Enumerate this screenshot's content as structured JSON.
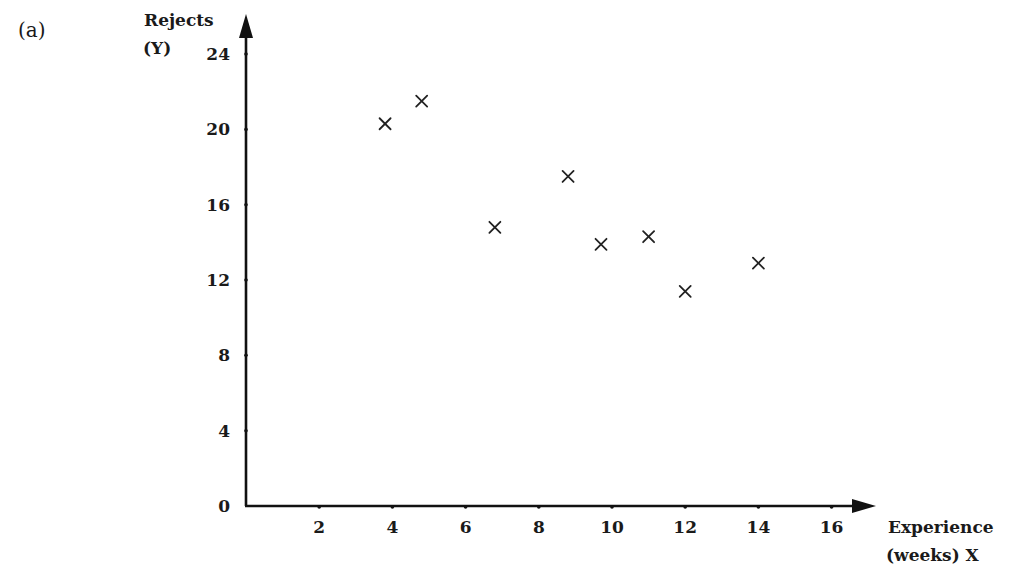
{
  "panel_label": "(a)",
  "y_axis": {
    "title_line1": "Rejects",
    "title_line2": "(Y)",
    "ticks": [
      0,
      4,
      8,
      12,
      16,
      20,
      24
    ]
  },
  "x_axis": {
    "title_line1": "Experience",
    "title_line2": "(weeks) X",
    "ticks": [
      2,
      4,
      6,
      8,
      10,
      12,
      14,
      16
    ]
  },
  "colors": {
    "ink": "#111111",
    "background": "#ffffff"
  },
  "chart_data": {
    "type": "scatter",
    "title": "",
    "panel": "(a)",
    "xlabel": "Experience (weeks) X",
    "ylabel": "Rejects (Y)",
    "xlim": [
      0,
      17
    ],
    "ylim": [
      0,
      25
    ],
    "x_ticks": [
      2,
      4,
      6,
      8,
      10,
      12,
      14,
      16
    ],
    "y_ticks": [
      0,
      4,
      8,
      12,
      16,
      20,
      24
    ],
    "marker": "x",
    "grid": false,
    "legend": null,
    "series": [
      {
        "name": "Rejects vs Experience",
        "points": [
          {
            "x": 3.8,
            "y": 20.3
          },
          {
            "x": 4.8,
            "y": 21.5
          },
          {
            "x": 6.8,
            "y": 14.8
          },
          {
            "x": 8.8,
            "y": 17.5
          },
          {
            "x": 9.7,
            "y": 13.9
          },
          {
            "x": 11.0,
            "y": 14.3
          },
          {
            "x": 12.0,
            "y": 11.4
          },
          {
            "x": 14.0,
            "y": 12.9
          }
        ]
      }
    ]
  }
}
